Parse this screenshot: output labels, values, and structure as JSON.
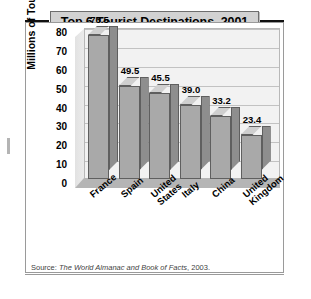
{
  "title": "Top 6 Tourist Destinations, 2001",
  "source": {
    "label": "Source: ",
    "publication": "The World Almanac and Book of Facts",
    "year": ", 2003."
  },
  "colors": {
    "bar_front": "#a9a9a9",
    "bar_top": "#cfcfcf",
    "bar_side": "#8e8e8e",
    "plot_background": "#f2f2f2",
    "gridline": "#c2c2c2",
    "title_box": "#d2d2d2",
    "frame": "#9a9a9a"
  },
  "chart_data": {
    "type": "bar",
    "title": "Top 6 Tourist Destinations, 2001",
    "xlabel": "",
    "ylabel": "Millions of Tourists",
    "categories": [
      "France",
      "Spain",
      "United States",
      "Italy",
      "China",
      "United Kingdom"
    ],
    "values": [
      76.5,
      49.5,
      45.5,
      39.0,
      33.2,
      23.4
    ],
    "value_labels": [
      "76.5",
      "49.5",
      "45.5",
      "39.0",
      "33.2",
      "23.4"
    ],
    "ylim": [
      0,
      80
    ],
    "yticks": [
      0,
      10,
      20,
      30,
      40,
      50,
      60,
      70,
      80
    ],
    "ytick_labels": [
      "0",
      "10",
      "20",
      "30",
      "40",
      "50",
      "60",
      "70",
      "80"
    ],
    "grid": true,
    "legend": "none",
    "style": "3d-column"
  }
}
